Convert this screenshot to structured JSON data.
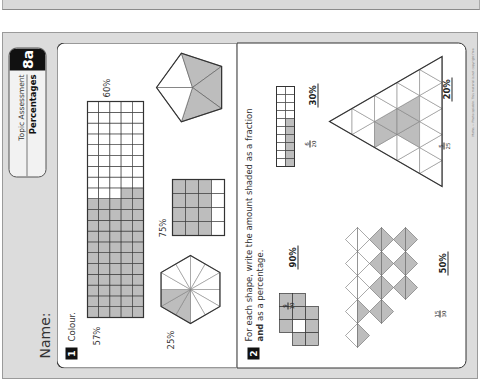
{
  "worksheet": {
    "name_label": "Name:",
    "header": {
      "topic": "Topic Assessment",
      "subject": "Percentages",
      "badge": "8a"
    },
    "copyright": "Maths — Photocopiable. This material is not copyright free.",
    "questions": [
      {
        "number": "1",
        "instruction": "Colour.",
        "items": [
          {
            "shape": "rectangle-grid",
            "cols": 5,
            "rows": 20,
            "shaded_cells": 57,
            "label": "57%"
          },
          {
            "shape": "hexagon-12-sectors",
            "shaded_sectors": 3,
            "label": "25%"
          },
          {
            "shape": "square-grid-4x4",
            "shaded_cells": 12,
            "label": "75%"
          },
          {
            "shape": "pentagon-5-sectors",
            "shaded_sectors": 3,
            "label": "60%"
          }
        ]
      },
      {
        "number": "2",
        "instruction_pre": "For each shape, write the amount shaded as a fraction",
        "instruction_bold": "and",
        "instruction_post": "as a percentage.",
        "items": [
          {
            "shape": "rectangle-grid-2x10",
            "fraction_num": "6",
            "fraction_den": "20",
            "percentage": "30%"
          },
          {
            "shape": "triangle-grid",
            "fraction_num": "5",
            "fraction_den": "25",
            "percentage": "20%"
          },
          {
            "shape": "square-cluster",
            "fraction_num": "9",
            "fraction_den": "10",
            "percentage": "90%"
          },
          {
            "shape": "zigzag-triangles",
            "fraction_num": "15",
            "fraction_den": "30",
            "percentage": "50%"
          }
        ]
      }
    ]
  },
  "colors": {
    "shade": "#bdbdbd",
    "line": "#333333",
    "scan_bg": "#dcdcdc",
    "badge_bg": "#111111"
  }
}
